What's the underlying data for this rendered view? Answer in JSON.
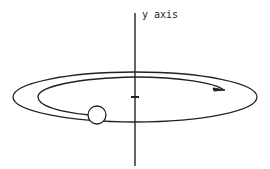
{
  "diagram": {
    "axis_label": "y axis",
    "elements": [
      "vertical axis",
      "outer elliptical orbit",
      "inner spiral path with arrow",
      "ball",
      "center tick"
    ],
    "colors": {
      "stroke": "#222222",
      "background": "#ffffff"
    }
  }
}
